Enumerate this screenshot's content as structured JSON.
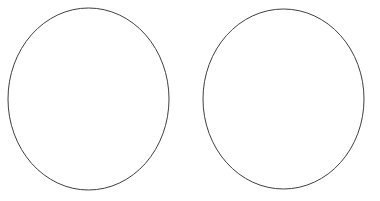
{
  "canvas": {
    "width": 380,
    "height": 201,
    "background_color": "#ffffff",
    "title": "Two Circles"
  },
  "shapes": [
    {
      "name": "left-circle",
      "type": "ellipse",
      "cx": 88.5,
      "cy": 99,
      "rx": 80.5,
      "ry": 91,
      "stroke_color": "#3f3f3f",
      "stroke_width": 1,
      "fill": "none",
      "bbox": {
        "x": 8,
        "y": 8,
        "width": 161,
        "height": 182
      }
    },
    {
      "name": "right-circle",
      "type": "ellipse",
      "cx": 283.5,
      "cy": 99,
      "rx": 80.5,
      "ry": 90,
      "stroke_color": "#3f3f3f",
      "stroke_width": 1,
      "fill": "none",
      "bbox": {
        "x": 203,
        "y": 9,
        "width": 161,
        "height": 180
      }
    }
  ]
}
